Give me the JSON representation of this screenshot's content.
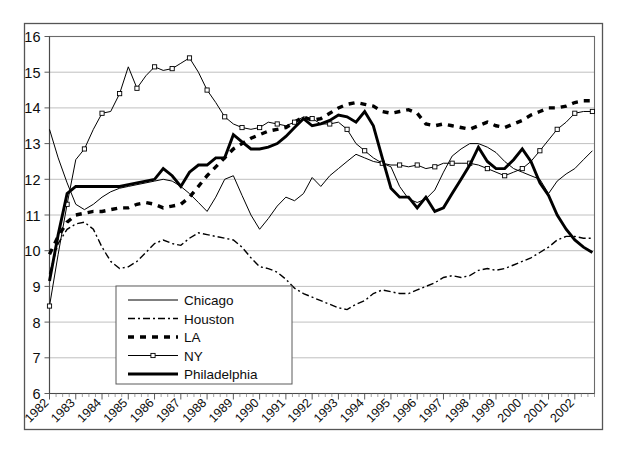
{
  "chart_data": {
    "type": "line",
    "title": "",
    "subtitle": "",
    "xlabel": "",
    "ylabel": "",
    "xlim": [
      1982,
      2002.75
    ],
    "ylim": [
      6,
      16
    ],
    "ytick_values": [
      6,
      7,
      8,
      9,
      10,
      11,
      12,
      13,
      14,
      15,
      16
    ],
    "ytick_labels": [
      "6",
      "7",
      "8",
      "9",
      "10",
      "11",
      "12",
      "13",
      "14",
      "15",
      "16"
    ],
    "xtick_labels": [
      "1982",
      "1983",
      "1984",
      "1985",
      "1986",
      "1987",
      "1988",
      "1989",
      "1990",
      "1991",
      "1992",
      "1993",
      "1994",
      "1995",
      "1996",
      "1997",
      "1998",
      "1999",
      "2000",
      "2001",
      "2002"
    ],
    "xtick_values": [
      1982,
      1983,
      1984,
      1985,
      1986,
      1987,
      1988,
      1989,
      1990,
      1991,
      1992,
      1993,
      1994,
      1995,
      1996,
      1997,
      1998,
      1999,
      2000,
      2001,
      2002
    ],
    "grid": "horizontal",
    "grid_on": true,
    "legend_position": "lower-left-inside",
    "x_tick_label_rotation": -45,
    "minor_ticks_per_interval": 3,
    "x": [
      1982.0,
      1982.33,
      1982.67,
      1983.0,
      1983.33,
      1983.67,
      1984.0,
      1984.33,
      1984.67,
      1985.0,
      1985.33,
      1985.67,
      1986.0,
      1986.33,
      1986.67,
      1987.0,
      1987.33,
      1987.67,
      1988.0,
      1988.33,
      1988.67,
      1989.0,
      1989.33,
      1989.67,
      1990.0,
      1990.33,
      1990.67,
      1991.0,
      1991.33,
      1991.67,
      1992.0,
      1992.33,
      1992.67,
      1993.0,
      1993.33,
      1993.67,
      1994.0,
      1994.33,
      1994.67,
      1995.0,
      1995.33,
      1995.67,
      1996.0,
      1996.33,
      1996.67,
      1997.0,
      1997.33,
      1997.67,
      1998.0,
      1998.33,
      1998.67,
      1999.0,
      1999.33,
      1999.67,
      2000.0,
      2000.33,
      2000.67,
      2001.0,
      2001.33,
      2001.67,
      2002.0,
      2002.33,
      2002.67
    ],
    "series": [
      {
        "name": "Chicago",
        "style": "thin-solid",
        "color": "#000000",
        "values": [
          13.4,
          12.6,
          11.9,
          11.3,
          11.15,
          11.3,
          11.5,
          11.65,
          11.75,
          11.8,
          11.85,
          11.9,
          11.95,
          12.0,
          11.95,
          11.8,
          11.6,
          11.35,
          11.1,
          11.5,
          12.0,
          12.1,
          11.55,
          11.0,
          10.6,
          10.9,
          11.25,
          11.5,
          11.4,
          11.6,
          12.05,
          11.8,
          12.1,
          12.3,
          12.5,
          12.7,
          12.6,
          12.5,
          12.45,
          12.35,
          11.8,
          11.45,
          11.35,
          11.45,
          11.7,
          12.2,
          12.65,
          12.85,
          13.0,
          13.0,
          12.9,
          12.75,
          12.5,
          12.3,
          12.2,
          12.1,
          12.0,
          11.6,
          11.95,
          12.15,
          12.3,
          12.55,
          12.8
        ]
      },
      {
        "name": "Houston",
        "style": "dash-dot",
        "color": "#000000",
        "values": [
          9.35,
          10.2,
          10.6,
          10.75,
          10.8,
          10.6,
          10.1,
          9.7,
          9.5,
          9.55,
          9.7,
          9.95,
          10.2,
          10.3,
          10.2,
          10.15,
          10.35,
          10.5,
          10.45,
          10.4,
          10.35,
          10.3,
          10.1,
          9.8,
          9.55,
          9.5,
          9.4,
          9.2,
          8.95,
          8.8,
          8.7,
          8.6,
          8.5,
          8.4,
          8.35,
          8.5,
          8.6,
          8.8,
          8.9,
          8.85,
          8.8,
          8.8,
          8.9,
          9.0,
          9.1,
          9.25,
          9.3,
          9.25,
          9.3,
          9.45,
          9.5,
          9.45,
          9.5,
          9.6,
          9.7,
          9.8,
          9.95,
          10.1,
          10.3,
          10.4,
          10.4,
          10.35,
          10.35
        ]
      },
      {
        "name": "LA",
        "style": "thick-dashed",
        "color": "#000000",
        "values": [
          9.9,
          10.4,
          10.8,
          11.0,
          11.05,
          11.1,
          11.1,
          11.15,
          11.2,
          11.2,
          11.3,
          11.35,
          11.3,
          11.2,
          11.25,
          11.3,
          11.5,
          11.8,
          12.1,
          12.35,
          12.6,
          12.85,
          13.0,
          13.15,
          13.25,
          13.35,
          13.4,
          13.45,
          13.6,
          13.75,
          13.65,
          13.7,
          13.85,
          14.0,
          14.1,
          14.15,
          14.1,
          14.05,
          13.9,
          13.85,
          13.9,
          13.95,
          13.85,
          13.55,
          13.5,
          13.55,
          13.5,
          13.45,
          13.4,
          13.5,
          13.6,
          13.5,
          13.45,
          13.55,
          13.65,
          13.8,
          13.9,
          14.0,
          14.0,
          14.05,
          14.15,
          14.2,
          14.2
        ]
      },
      {
        "name": "NY",
        "style": "thin-solid-square-markers",
        "color": "#000000",
        "values": [
          8.45,
          9.9,
          11.3,
          12.55,
          12.85,
          13.4,
          13.85,
          13.9,
          14.4,
          15.15,
          14.55,
          14.9,
          15.15,
          15.05,
          15.1,
          15.25,
          15.4,
          15.0,
          14.5,
          14.15,
          13.75,
          13.55,
          13.45,
          13.4,
          13.45,
          13.6,
          13.55,
          13.5,
          13.6,
          13.75,
          13.7,
          13.55,
          13.55,
          13.6,
          13.4,
          13.0,
          12.8,
          12.6,
          12.45,
          12.4,
          12.4,
          12.35,
          12.4,
          12.3,
          12.35,
          12.45,
          12.45,
          12.45,
          12.45,
          12.4,
          12.3,
          12.2,
          12.1,
          12.2,
          12.3,
          12.5,
          12.8,
          13.1,
          13.4,
          13.6,
          13.85,
          13.9,
          13.9
        ]
      },
      {
        "name": "Philadelphia",
        "style": "thick-solid",
        "color": "#000000",
        "values": [
          9.15,
          10.45,
          11.6,
          11.8,
          11.8,
          11.8,
          11.8,
          11.8,
          11.8,
          11.85,
          11.9,
          11.95,
          12.0,
          12.3,
          12.1,
          11.8,
          12.2,
          12.4,
          12.4,
          12.6,
          12.6,
          13.25,
          13.05,
          12.85,
          12.85,
          12.9,
          13.0,
          13.2,
          13.45,
          13.7,
          13.5,
          13.55,
          13.65,
          13.8,
          13.75,
          13.6,
          13.9,
          13.5,
          12.6,
          11.75,
          11.5,
          11.5,
          11.2,
          11.5,
          11.1,
          11.2,
          11.6,
          12.0,
          12.4,
          12.9,
          12.5,
          12.3,
          12.3,
          12.55,
          12.85,
          12.5,
          11.9,
          11.55,
          11.0,
          10.6,
          10.3,
          10.1,
          9.95
        ]
      }
    ]
  },
  "legend": {
    "entries": [
      {
        "label": "Chicago",
        "style": "thin-solid"
      },
      {
        "label": "Houston",
        "style": "dash-dot"
      },
      {
        "label": "LA",
        "style": "thick-dashed"
      },
      {
        "label": "NY",
        "style": "thin-solid-square-markers"
      },
      {
        "label": "Philadelphia",
        "style": "thick-solid"
      }
    ]
  }
}
